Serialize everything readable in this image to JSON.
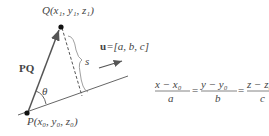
{
  "diagram": {
    "point_q_label": "Q(x₁, y₁, z₁)",
    "point_p_label": "P(x₀, y₀, z₀)",
    "vector_pq_label": "PQ",
    "angle_label": "θ",
    "distance_label": "s",
    "direction_vector_label": "u=[a, b, c]",
    "direction_vector_bold": "u",
    "direction_vector_rest": "=[a, b, c]",
    "equation": {
      "x_num": "x − x₀",
      "x_den": "a",
      "y_num": "y − y₀",
      "y_den": "b",
      "z_num": "z − z₀",
      "z_den": "c",
      "eq1": "=",
      "eq2": "="
    }
  }
}
